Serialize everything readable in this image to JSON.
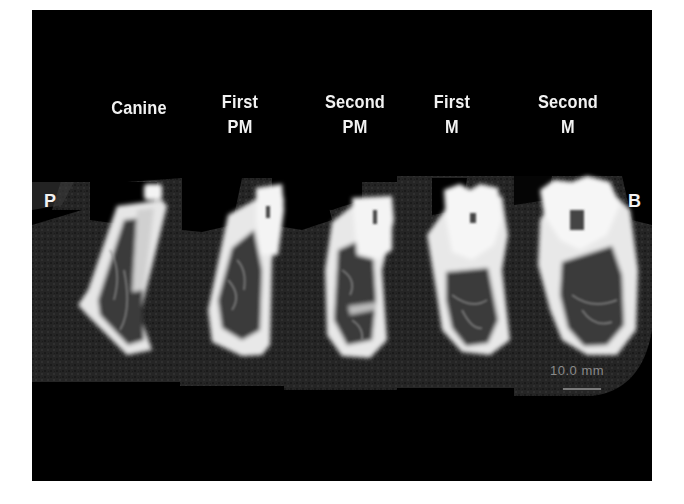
{
  "figure": {
    "orientation_labels": {
      "left": "P",
      "right": "B"
    },
    "columns": [
      {
        "line1": "",
        "line2": "Canine"
      },
      {
        "line1": "First",
        "line2": "PM"
      },
      {
        "line1": "Second",
        "line2": "PM"
      },
      {
        "line1": "First",
        "line2": "M"
      },
      {
        "line1": "Second",
        "line2": "M"
      }
    ],
    "scale_bar": {
      "label": "10.0 mm"
    },
    "colors": {
      "background": "#000000",
      "bone": "#f0f0f0",
      "soft_tissue": "#262626",
      "page": "#ffffff"
    }
  }
}
